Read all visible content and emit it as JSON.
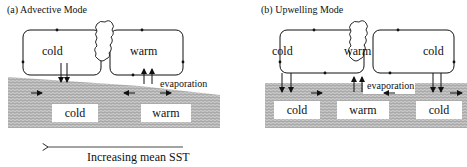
{
  "panels": {
    "a": {
      "title": "(a) Advective Mode",
      "atmosphere": {
        "left_label": "cold",
        "right_label": "warm"
      },
      "ocean": {
        "left_label": "cold",
        "right_label": "warm"
      },
      "flux_label": "evaporation"
    },
    "b": {
      "title": "(b) Upwelling Mode",
      "atmosphere": {
        "left_label": "cold",
        "center_label": "warm",
        "right_label": "cold"
      },
      "ocean": {
        "left_label": "cold",
        "center_label": "warm",
        "right_label": "cold"
      },
      "flux_label": "evaporation"
    }
  },
  "axis": {
    "label": "Increasing mean SST",
    "direction": "left-arrow"
  },
  "colors": {
    "ocean_hatch": "#9a9a9a",
    "line": "#111111",
    "background": "#ffffff"
  }
}
